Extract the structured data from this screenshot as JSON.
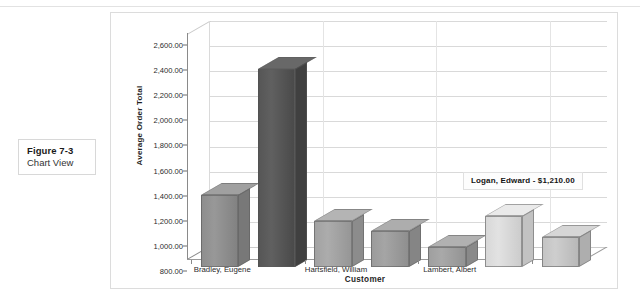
{
  "figure": {
    "label": "Figure 7-3",
    "caption": "Chart View"
  },
  "chart_data": {
    "type": "bar",
    "title": "",
    "subtitle": "",
    "xlabel": "Customer",
    "ylabel": "Average Order Total",
    "ylim": [
      800,
      2600
    ],
    "ytick_labels": [
      "2,600.00",
      "2,400.00",
      "2,200.00",
      "2,000.00",
      "1,800.00",
      "1,600.00",
      "1,400.00",
      "1,200.00",
      "1,000.00",
      "800.00"
    ],
    "ytick_values": [
      2600,
      2400,
      2200,
      2000,
      1800,
      1600,
      1400,
      1200,
      1000,
      800
    ],
    "grid": true,
    "legend": "none",
    "three_d": true,
    "xtick_labels": [
      "Bradley, Eugene",
      "Hartsfield, William",
      "Lambert, Albert"
    ],
    "categories": [
      "Bradley, Eugene",
      "",
      "Hartsfield, William",
      "",
      "Lambert, Albert",
      "Logan, Edward",
      ""
    ],
    "values": [
      1370,
      2380,
      1165,
      1085,
      960,
      1210,
      1040
    ],
    "bar_colors": [
      "#8e8e8e",
      "#565656",
      "#a2a2a2",
      "#9b9b9b",
      "#9f9f9f",
      "#d8d8d8",
      "#c4c4c4"
    ],
    "highlighted_index": 5,
    "annotations": [
      {
        "text": "Logan, Edward - $1,210.00",
        "series_index": 5
      }
    ]
  }
}
